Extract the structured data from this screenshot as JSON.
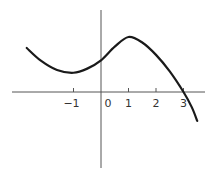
{
  "chart_data": {
    "type": "line",
    "title": "",
    "xlabel": "",
    "ylabel": "",
    "x_ticks": [
      -1,
      0,
      1,
      2,
      3
    ],
    "x_tick_labels": [
      "−1",
      "0",
      "1",
      "2",
      "3"
    ],
    "xlim": [
      -3.4,
      3.9
    ],
    "ylim": [
      -2.8,
      3.3
    ],
    "grid": false,
    "legend": null,
    "series": [
      {
        "name": "f(x)",
        "color": "#1a1a1a",
        "x": [
          -2.7,
          -2.2,
          -1.6,
          -1.0,
          -0.5,
          0.0,
          0.5,
          1.0,
          1.5,
          2.0,
          2.5,
          3.0,
          3.3,
          3.5
        ],
        "y": [
          1.6,
          1.15,
          0.8,
          0.7,
          0.85,
          1.15,
          1.65,
          2.0,
          1.8,
          1.35,
          0.75,
          0.0,
          -0.55,
          -1.05
        ]
      }
    ],
    "annotations": {
      "local_min": {
        "x": -1,
        "y": 0.7
      },
      "local_max": {
        "x": 1,
        "y": 2.0
      },
      "x_intercept": {
        "x": 3,
        "y": 0
      }
    }
  },
  "axes": {
    "color": "#555555",
    "curve_color": "#1a1a1a"
  }
}
